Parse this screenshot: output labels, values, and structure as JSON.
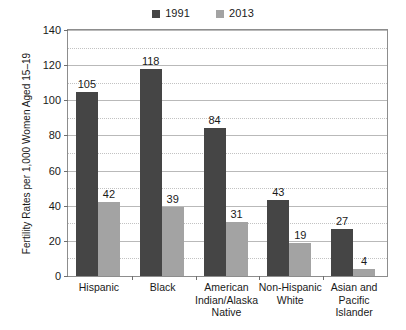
{
  "chart_data": {
    "type": "bar",
    "title": "",
    "subtitle": "",
    "xlabel": "",
    "ylabel": "Fertility Rates per 1,000 Women Aged 15–19",
    "ylim": [
      0,
      140
    ],
    "ytick_step": 20,
    "yticks": [
      0,
      20,
      40,
      60,
      80,
      100,
      120,
      140
    ],
    "ytick_labels": [
      "0",
      "20",
      "40",
      "60",
      "80",
      "100",
      "120",
      "140"
    ],
    "grid": true,
    "grid_axis": "y",
    "legend_position": "top-center",
    "categories": [
      "Hispanic",
      "Black",
      "American Indian/Alaska Native",
      "Non-Hispanic White",
      "Asian and Pacific Islander"
    ],
    "category_label_lines": [
      [
        "Hispanic"
      ],
      [
        "Black"
      ],
      [
        "American",
        "Indian/Alaska",
        "Native"
      ],
      [
        "Non-Hispanic",
        "White"
      ],
      [
        "Asian and",
        "Pacific",
        "Islander"
      ]
    ],
    "series": [
      {
        "name": "1991",
        "color": "#454545",
        "values": [
          105,
          118,
          84,
          43,
          27
        ]
      },
      {
        "name": "2013",
        "color": "#a3a3a3",
        "values": [
          42,
          39,
          31,
          19,
          4
        ]
      }
    ]
  },
  "legend": {
    "entries": [
      {
        "label": "1991",
        "color": "#454545"
      },
      {
        "label": "2013",
        "color": "#a3a3a3"
      }
    ]
  },
  "axis": {
    "y_title": "Fertility Rates per 1,000 Women Aged 15–19"
  },
  "colors": {
    "series_1991": "#454545",
    "series_2013": "#a3a3a3",
    "frame": "#8d8d8d",
    "gridline_major": "#b9b9b9",
    "gridline_minor": "#c2c2c2",
    "text": "#1a1a1a",
    "background": "#ffffff"
  }
}
